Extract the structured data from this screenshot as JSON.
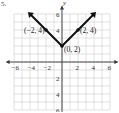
{
  "problem_label": "5.",
  "chart_data": {
    "type": "line",
    "title": "",
    "function": "y = |x| + 2",
    "xlabel": "",
    "ylabel": "y",
    "xlim": [
      -6,
      6
    ],
    "ylim": [
      -6,
      6
    ],
    "grid": true,
    "x_ticks": [
      -6,
      -4,
      -2,
      2,
      4,
      6
    ],
    "y_ticks": [
      6,
      4,
      2,
      -2,
      -4,
      -6
    ],
    "x_tick_labels": [
      "−6",
      "−4",
      "−2",
      "2",
      "4",
      "6"
    ],
    "y_tick_labels": [
      "6",
      "4",
      "2",
      "2",
      "4",
      "6"
    ],
    "series": [
      {
        "name": "y = |x| + 2",
        "x": [
          -4,
          -2,
          0,
          2,
          4
        ],
        "y": [
          6,
          4,
          2,
          4,
          6
        ],
        "arrows": "both ends"
      }
    ],
    "annotations": [
      {
        "text": "(−2, 4)",
        "x": -2,
        "y": 4
      },
      {
        "text": "(0, 2)",
        "x": 0,
        "y": 2
      },
      {
        "text": "(2, 4)",
        "x": 2,
        "y": 4
      }
    ]
  }
}
